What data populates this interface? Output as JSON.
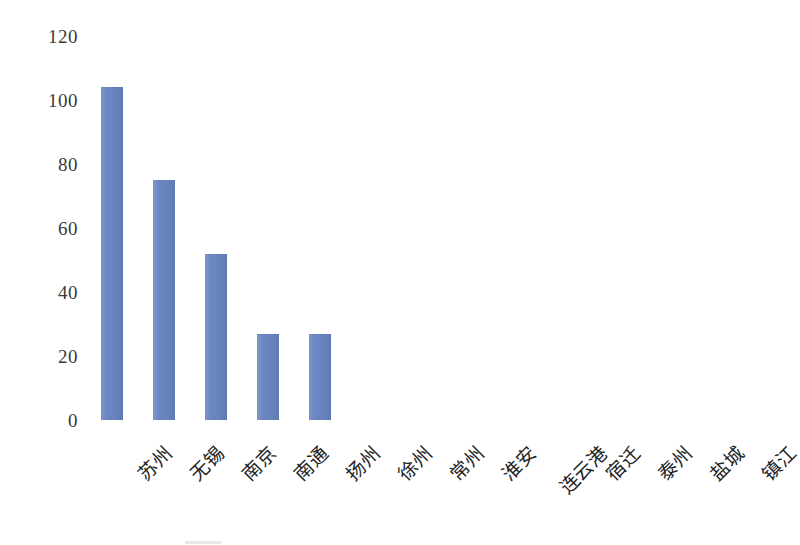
{
  "chart_data": {
    "type": "bar",
    "title": "",
    "subtitle": "",
    "xlabel": "",
    "ylabel": "",
    "categories": [
      "苏州",
      "无锡",
      "南京",
      "南通",
      "扬州",
      "徐州",
      "常州",
      "淮安",
      "连云港",
      "宿迁",
      "泰州",
      "盐城",
      "镇江"
    ],
    "values": [
      104,
      75,
      52,
      27,
      27,
      0,
      0,
      0,
      0,
      0,
      0,
      0,
      0
    ],
    "series": [
      {
        "name": "",
        "values": [
          104,
          75,
          52,
          27,
          27,
          0,
          0,
          0,
          0,
          0,
          0,
          0,
          0
        ],
        "color": "#6A86C2"
      }
    ],
    "ylim": [
      0,
      120
    ],
    "ytick_labels": [
      "0",
      "20",
      "40",
      "60",
      "80",
      "100",
      "120"
    ],
    "ytick_values": [
      0,
      20,
      40,
      60,
      80,
      100,
      120
    ],
    "grid": false,
    "legend": false,
    "legend_position": "none",
    "bar_color": "#6A86C2",
    "background_color": "#FFFFFF",
    "axis_text_color": "#2B2B2B",
    "xtick_rotation_degrees": -45,
    "annotations": []
  }
}
